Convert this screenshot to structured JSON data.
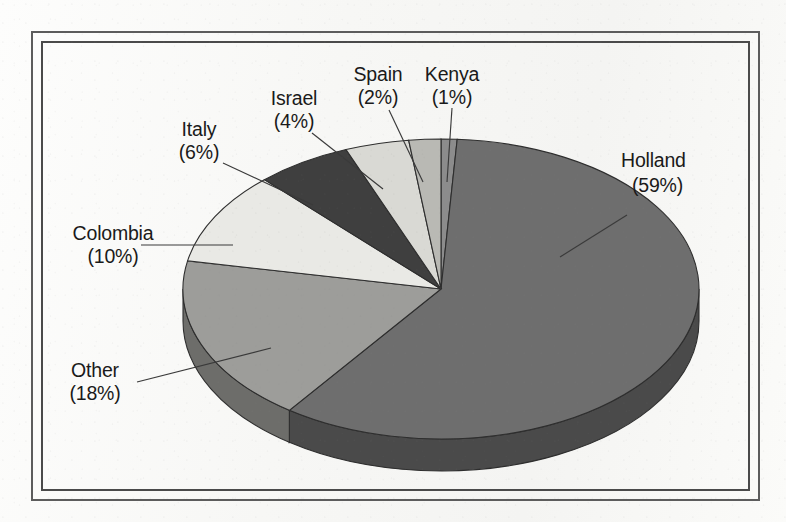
{
  "figure": {
    "background_color": "#f7f7f5",
    "frame": {
      "name": "double-rule-border",
      "outer_color": "#5c5c5c",
      "inner_color": "#4a4a4a"
    }
  },
  "chart_data": {
    "type": "pie",
    "title": "",
    "subtitle": "",
    "xlabel": "",
    "ylabel": "",
    "legend_position": "none",
    "grid": false,
    "three_d": true,
    "start_angle_deg": 0,
    "direction": "clockwise",
    "units": "percent",
    "categories": [
      "Kenya",
      "Holland",
      "Other",
      "Colombia",
      "Italy",
      "Israel",
      "Spain"
    ],
    "values": [
      1,
      59,
      18,
      10,
      6,
      4,
      2
    ],
    "slices": [
      {
        "label": "Kenya",
        "value": 1,
        "percent_text": "(1%)",
        "label_text": "Kenya",
        "color": "#8c8c8c",
        "side_color": "#5e5e5e"
      },
      {
        "label": "Holland",
        "value": 59,
        "percent_text": "(59%)",
        "label_text": "Holland",
        "color": "#6e6e6e",
        "side_color": "#4a4a4a"
      },
      {
        "label": "Other",
        "value": 18,
        "percent_text": "(18%)",
        "label_text": "Other",
        "color": "#9d9d9a",
        "side_color": "#6d6d6a"
      },
      {
        "label": "Colombia",
        "value": 10,
        "percent_text": "(10%)",
        "label_text": "Colombia",
        "color": "#e9e9e5",
        "side_color": "#b5b5b1"
      },
      {
        "label": "Italy",
        "value": 6,
        "percent_text": "(6%)",
        "label_text": "Italy",
        "color": "#3f3f3f",
        "side_color": "#2b2b2b"
      },
      {
        "label": "Israel",
        "value": 4,
        "percent_text": "(4%)",
        "label_text": "Israel",
        "color": "#d9d9d4",
        "side_color": "#a8a8a4"
      },
      {
        "label": "Spain",
        "value": 2,
        "percent_text": "(2%)",
        "label_text": "Spain",
        "color": "#b9b9b4",
        "side_color": "#8a8a86"
      }
    ]
  },
  "labels": {
    "holland": {
      "name": "Holland",
      "percent": "(59%)"
    },
    "kenya": {
      "name": "Kenya",
      "percent": "(1%)"
    },
    "spain": {
      "name": "Spain",
      "percent": "(2%)"
    },
    "israel": {
      "name": "Israel",
      "percent": "(4%)"
    },
    "italy": {
      "name": "Italy",
      "percent": "(6%)"
    },
    "colombia": {
      "name": "Colombia",
      "percent": "(10%)"
    },
    "other": {
      "name": "Other",
      "percent": "(18%)"
    }
  }
}
